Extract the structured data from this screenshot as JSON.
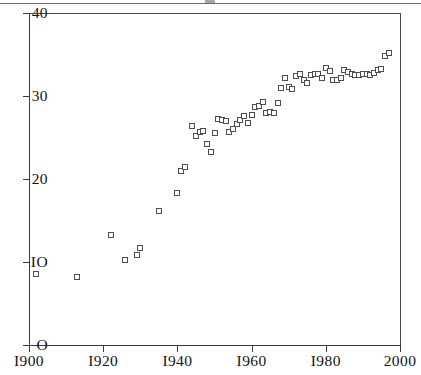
{
  "chart": {
    "type": "scatter",
    "title": "",
    "xlabel": "",
    "ylabel": ""
  },
  "axes": {
    "y_ticks": [
      {
        "value": 40,
        "label": "40"
      },
      {
        "value": 30,
        "label": "30"
      },
      {
        "value": 20,
        "label": "20"
      },
      {
        "value": 10,
        "label": "IO"
      },
      {
        "value": 0,
        "label": "O"
      }
    ],
    "x_ticks": [
      {
        "value": 1900,
        "label": "I900"
      },
      {
        "value": 1920,
        "label": "I920"
      },
      {
        "value": 1940,
        "label": "I940"
      },
      {
        "value": 1960,
        "label": "I960"
      },
      {
        "value": 1980,
        "label": "I980"
      },
      {
        "value": 2000,
        "label": "2000"
      }
    ],
    "xlim": [
      1900,
      2000
    ],
    "ylim": [
      0,
      40
    ],
    "grid": false,
    "legend": false
  },
  "style": {
    "marker": "open-square",
    "marker_color": "#4d4d4d",
    "marker_fill": "#ffffff",
    "axis_color": "#3a3a3a",
    "background": "#ffffff"
  },
  "chart_data": {
    "type": "scatter",
    "title": "",
    "xlabel": "",
    "ylabel": "",
    "xlim": [
      1900,
      2000
    ],
    "ylim": [
      0,
      40
    ],
    "grid": false,
    "legend_position": "none",
    "x": [
      1902,
      1913,
      1922,
      1926,
      1929,
      1930,
      1935,
      1940,
      1941,
      1942,
      1944,
      1945,
      1946,
      1947,
      1948,
      1949,
      1950,
      1951,
      1952,
      1953,
      1954,
      1955,
      1956,
      1957,
      1958,
      1959,
      1960,
      1961,
      1962,
      1963,
      1964,
      1965,
      1966,
      1967,
      1968,
      1969,
      1970,
      1971,
      1972,
      1973,
      1974,
      1975,
      1976,
      1977,
      1978,
      1979,
      1980,
      1981,
      1982,
      1983,
      1984,
      1985,
      1986,
      1987,
      1988,
      1989,
      1990,
      1991,
      1992,
      1993,
      1994,
      1995,
      1996,
      1997
    ],
    "y": [
      8.5,
      8.2,
      13.2,
      10.2,
      10.8,
      11.7,
      16.1,
      18.3,
      21.0,
      21.4,
      26.4,
      25.2,
      25.7,
      25.8,
      24.2,
      23.2,
      25.6,
      27.2,
      27.1,
      27.0,
      25.7,
      26.0,
      26.6,
      27.1,
      27.6,
      26.8,
      27.7,
      28.7,
      28.8,
      29.3,
      28.0,
      28.1,
      28.0,
      29.2,
      31.0,
      32.2,
      31.1,
      30.9,
      32.4,
      32.7,
      31.9,
      31.6,
      32.5,
      32.7,
      32.6,
      32.2,
      33.4,
      33.0,
      31.9,
      31.9,
      32.2,
      33.1,
      32.9,
      32.6,
      32.5,
      32.5,
      32.6,
      32.7,
      32.5,
      32.8,
      33.1,
      33.2,
      34.8,
      35.2
    ],
    "series": [
      {
        "name": "observations",
        "points": [
          [
            1902,
            8.5
          ],
          [
            1913,
            8.2
          ],
          [
            1922,
            13.2
          ],
          [
            1926,
            10.2
          ],
          [
            1929,
            10.8
          ],
          [
            1930,
            11.7
          ],
          [
            1935,
            16.1
          ],
          [
            1940,
            18.3
          ],
          [
            1941,
            21.0
          ],
          [
            1942,
            21.4
          ],
          [
            1944,
            26.4
          ],
          [
            1945,
            25.2
          ],
          [
            1946,
            25.7
          ],
          [
            1947,
            25.8
          ],
          [
            1948,
            24.2
          ],
          [
            1949,
            23.2
          ],
          [
            1950,
            25.6
          ],
          [
            1951,
            27.2
          ],
          [
            1952,
            27.1
          ],
          [
            1953,
            27.0
          ],
          [
            1954,
            25.7
          ],
          [
            1955,
            26.0
          ],
          [
            1956,
            26.6
          ],
          [
            1957,
            27.1
          ],
          [
            1958,
            27.6
          ],
          [
            1959,
            26.8
          ],
          [
            1960,
            27.7
          ],
          [
            1961,
            28.7
          ],
          [
            1962,
            28.8
          ],
          [
            1963,
            29.3
          ],
          [
            1964,
            28.0
          ],
          [
            1965,
            28.1
          ],
          [
            1966,
            28.0
          ],
          [
            1967,
            29.2
          ],
          [
            1968,
            31.0
          ],
          [
            1969,
            32.2
          ],
          [
            1970,
            31.1
          ],
          [
            1971,
            30.9
          ],
          [
            1972,
            32.4
          ],
          [
            1973,
            32.7
          ],
          [
            1974,
            31.9
          ],
          [
            1975,
            31.6
          ],
          [
            1976,
            32.5
          ],
          [
            1977,
            32.7
          ],
          [
            1978,
            32.6
          ],
          [
            1979,
            32.2
          ],
          [
            1980,
            33.4
          ],
          [
            1981,
            33.0
          ],
          [
            1982,
            31.9
          ],
          [
            1983,
            31.9
          ],
          [
            1984,
            32.2
          ],
          [
            1985,
            33.1
          ],
          [
            1986,
            32.9
          ],
          [
            1987,
            32.6
          ],
          [
            1988,
            32.5
          ],
          [
            1989,
            32.5
          ],
          [
            1990,
            32.6
          ],
          [
            1991,
            32.7
          ],
          [
            1992,
            32.5
          ],
          [
            1993,
            32.8
          ],
          [
            1994,
            33.1
          ],
          [
            1995,
            33.2
          ],
          [
            1996,
            34.8
          ],
          [
            1997,
            35.2
          ]
        ]
      }
    ]
  }
}
